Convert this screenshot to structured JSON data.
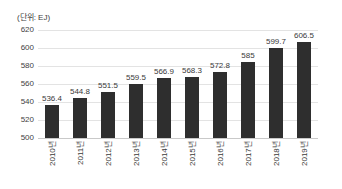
{
  "chart_data": {
    "type": "bar",
    "title": "",
    "subtitle": "",
    "unit_label": "(단위: EJ)",
    "xlabel": "",
    "ylabel": "",
    "categories": [
      "2010년",
      "2011년",
      "2012년",
      "2013년",
      "2014년",
      "2015년",
      "2016년",
      "2017년",
      "2018년",
      "2019년"
    ],
    "values": [
      536.4,
      544.8,
      551.5,
      559.5,
      566.9,
      568.3,
      572.8,
      585,
      599.7,
      606.5
    ],
    "value_labels": [
      "536.4",
      "544.8",
      "551.5",
      "559.5",
      "566.9",
      "568.3",
      "572.8",
      "585",
      "599.7",
      "606.5"
    ],
    "ylim": [
      500,
      620
    ],
    "ytick_values": [
      620,
      600,
      580,
      560,
      540,
      520,
      500
    ],
    "ytick_labels": [
      "620",
      "600",
      "580",
      "560",
      "540",
      "520",
      "500"
    ],
    "grid": true,
    "legend": null,
    "legend_position": "none",
    "bar_color": "#2e2e2e",
    "gridline_color": "#e3e3e3",
    "axis_color": "#c9c9c9",
    "background_color": "#ffffff",
    "label_rotation": -90
  }
}
